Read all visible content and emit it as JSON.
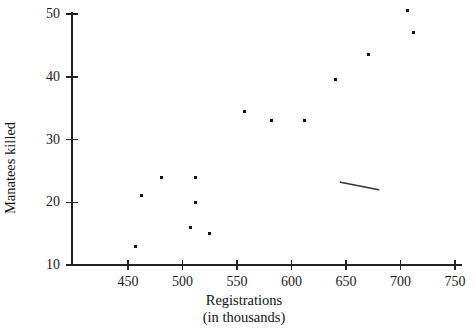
{
  "chart_data": {
    "type": "scatter",
    "title": "",
    "xlabel": "Registrations\n(in thousands)",
    "xlabel_line1": "Registrations",
    "xlabel_line2": "(in thousands)",
    "ylabel": "Manatees killed",
    "xlim": [
      420,
      750
    ],
    "ylim": [
      10,
      50
    ],
    "xticks": [
      450,
      500,
      550,
      600,
      650,
      700,
      750
    ],
    "xtick_labels": [
      "450",
      "500",
      "550",
      "600",
      "650",
      "700",
      "750"
    ],
    "yticks": [
      10,
      20,
      30,
      40,
      50
    ],
    "ytick_labels": [
      "10",
      "20",
      "30",
      "40",
      "50"
    ],
    "grid": false,
    "legend": null,
    "marker": "square",
    "marker_color": "#111111",
    "marker_size": 3,
    "axis_color": "#222222",
    "points": [
      {
        "x": 457,
        "y": 13
      },
      {
        "x": 462,
        "y": 21
      },
      {
        "x": 481,
        "y": 24
      },
      {
        "x": 507,
        "y": 16
      },
      {
        "x": 512,
        "y": 24
      },
      {
        "x": 512,
        "y": 20
      },
      {
        "x": 525,
        "y": 15
      },
      {
        "x": 557,
        "y": 34.5
      },
      {
        "x": 582,
        "y": 33
      },
      {
        "x": 612,
        "y": 33
      },
      {
        "x": 640,
        "y": 39.5
      },
      {
        "x": 671,
        "y": 43.5
      },
      {
        "x": 706,
        "y": 50.5
      },
      {
        "x": 712,
        "y": 47
      }
    ],
    "annotations": [
      {
        "name": "short-line-segment",
        "type": "line",
        "x1": 645,
        "y1": 23.2,
        "x2": 680,
        "y2": 22.0,
        "color": "#333333"
      }
    ]
  }
}
